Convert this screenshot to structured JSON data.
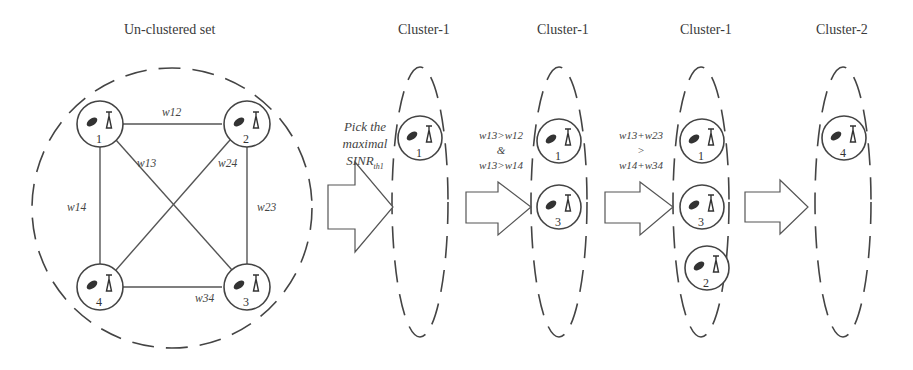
{
  "titles": {
    "unclustered": "Un-clustered set",
    "stage1": "Cluster-1",
    "stage2": "Cluster-1",
    "stage3": "Cluster-1",
    "stage4": "Cluster-2"
  },
  "graph": {
    "nodes": [
      "1",
      "2",
      "3",
      "4"
    ],
    "edges": {
      "w12": "w12",
      "w13": "w13",
      "w14": "w14",
      "w23": "w23",
      "w24": "w24",
      "w34": "w34"
    }
  },
  "steps": {
    "step1": {
      "line1": "Pick the",
      "line2": "maximal",
      "line3_main": "SINR",
      "line3_sub": "th1"
    },
    "step2": {
      "line1": "w13>w12",
      "line2": "&",
      "line3": "w13>w14"
    },
    "step3": {
      "line1": "w13+w23",
      "line2": ">",
      "line3": "w14+w34"
    }
  },
  "clusters": {
    "stage1_nodes": [
      "1"
    ],
    "stage2_nodes": [
      "1",
      "3"
    ],
    "stage3_nodes": [
      "1",
      "3",
      "2"
    ],
    "stage4_nodes": [
      "4"
    ]
  },
  "colors": {
    "stroke": "#444444",
    "background": "#ffffff"
  }
}
